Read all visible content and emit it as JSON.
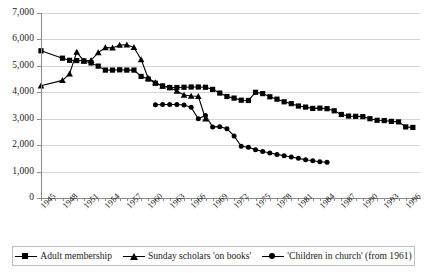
{
  "chart_data": {
    "type": "line",
    "title": "",
    "subtitle": "",
    "xlabel": "",
    "ylabel": "",
    "xlim": [
      1945,
      1998
    ],
    "ylim": [
      0,
      7000
    ],
    "grid": true,
    "legend_position": "bottom",
    "y_ticks": [
      0,
      1000,
      2000,
      3000,
      4000,
      5000,
      6000,
      7000
    ],
    "y_tick_labels": [
      "0",
      "1,000",
      "2,000",
      "3,000",
      "4,000",
      "5,000",
      "6,000",
      "7,000"
    ],
    "x_tick_labels": [
      "1945",
      "1948",
      "1951",
      "1954",
      "1957",
      "1960",
      "1963",
      "1966",
      "1969",
      "1972",
      "1975",
      "1978",
      "1981",
      "1984",
      "1987",
      "1990",
      "1993",
      "1996"
    ],
    "x_tick_years": [
      1945,
      1948,
      1951,
      1954,
      1957,
      1960,
      1963,
      1966,
      1969,
      1972,
      1975,
      1978,
      1981,
      1984,
      1987,
      1990,
      1993,
      1996
    ],
    "x_minor_years": [
      1945,
      1946,
      1947,
      1948,
      1949,
      1950,
      1951,
      1952,
      1953,
      1954,
      1955,
      1956,
      1957,
      1958,
      1959,
      1960,
      1961,
      1962,
      1963,
      1964,
      1965,
      1966,
      1967,
      1968,
      1969,
      1970,
      1971,
      1972,
      1973,
      1974,
      1975,
      1976,
      1977,
      1978,
      1979,
      1980,
      1981,
      1982,
      1983,
      1984,
      1985,
      1986,
      1987,
      1988,
      1989,
      1990,
      1991,
      1992,
      1993,
      1994,
      1995,
      1996,
      1997
    ],
    "series": [
      {
        "name": "Adult membership",
        "marker": "square",
        "color": "#000000",
        "x": [
          1945,
          1948,
          1949,
          1950,
          1951,
          1952,
          1953,
          1954,
          1955,
          1956,
          1957,
          1958,
          1959,
          1960,
          1961,
          1962,
          1963,
          1964,
          1965,
          1966,
          1967,
          1968,
          1969,
          1970,
          1971,
          1972,
          1973,
          1974,
          1975,
          1976,
          1977,
          1978,
          1979,
          1980,
          1981,
          1982,
          1983,
          1984,
          1985,
          1986,
          1987,
          1988,
          1989,
          1990,
          1991,
          1992,
          1993,
          1994,
          1995,
          1996,
          1997
        ],
        "values": [
          5570,
          5290,
          5210,
          5200,
          5190,
          5110,
          4990,
          4840,
          4840,
          4850,
          4840,
          4840,
          4600,
          4500,
          4340,
          4240,
          4180,
          4180,
          4190,
          4200,
          4200,
          4190,
          4110,
          3970,
          3840,
          3780,
          3700,
          3690,
          4000,
          3950,
          3830,
          3740,
          3640,
          3570,
          3480,
          3440,
          3390,
          3400,
          3380,
          3300,
          3160,
          3100,
          3090,
          3080,
          3000,
          2940,
          2930,
          2900,
          2880,
          2690,
          2670
        ],
        "connected": true
      },
      {
        "name": "Sunday scholars 'on books'",
        "marker": "triangle",
        "color": "#000000",
        "x": [
          1945,
          1948,
          1949,
          1950,
          1951,
          1952,
          1953,
          1954,
          1955,
          1956,
          1957,
          1958,
          1959,
          1960,
          1961,
          1962,
          1963,
          1964,
          1965,
          1966,
          1967,
          1968
        ],
        "values": [
          4250,
          4450,
          4700,
          5520,
          5180,
          5210,
          5500,
          5690,
          5680,
          5790,
          5800,
          5700,
          5240,
          4530,
          4370,
          4240,
          4180,
          4050,
          3900,
          3860,
          3850,
          3000
        ],
        "connected": true
      },
      {
        "name": "'Children in church' (from 1961)",
        "marker": "circle",
        "color": "#000000",
        "x": [
          1961,
          1962,
          1963,
          1964,
          1965,
          1966,
          1967,
          1968,
          1969,
          1970,
          1971,
          1972,
          1973,
          1974,
          1975,
          1976,
          1977,
          1978,
          1979,
          1980,
          1981,
          1982,
          1983,
          1984,
          1985
        ],
        "values": [
          3530,
          3540,
          3540,
          3540,
          3520,
          3430,
          3000,
          3120,
          2690,
          2700,
          2620,
          2350,
          1960,
          1920,
          1830,
          1760,
          1700,
          1650,
          1600,
          1550,
          1500,
          1450,
          1410,
          1370,
          1350
        ],
        "connected": true
      }
    ]
  },
  "legend": {
    "items": [
      {
        "label": "Adult membership",
        "marker": "square"
      },
      {
        "label": "Sunday scholars 'on books'",
        "marker": "triangle"
      },
      {
        "label": "'Children in church' (from 1961)",
        "marker": "circle"
      }
    ]
  }
}
